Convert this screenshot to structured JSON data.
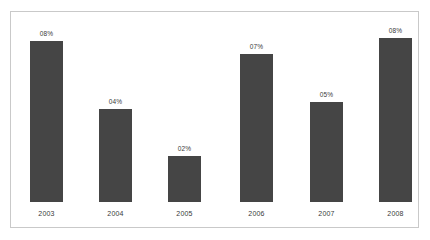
{
  "chart_data": {
    "type": "bar",
    "title": "",
    "subtitle": "",
    "xlabel": "",
    "ylabel": "",
    "categories": [
      "2003",
      "2004",
      "2005",
      "2006",
      "2007",
      "2008"
    ],
    "values": [
      8,
      4,
      2,
      7,
      5,
      8
    ],
    "data_labels": [
      "08%",
      "04%",
      "02%",
      "07%",
      "05%",
      "08%"
    ],
    "ylim": [
      0,
      8
    ],
    "grid": false,
    "legend": false,
    "legend_position": "none",
    "axis_ticks_visible": false,
    "series": [
      {
        "name": "",
        "values": [
          8,
          4,
          2,
          7,
          5,
          8
        ]
      }
    ]
  },
  "style": {
    "bar_color": "#454545",
    "background_color": "#ffffff",
    "border_color": "#c9c9c9",
    "label_color": "#3a3a3a"
  },
  "layout": {
    "bar_pixel_heights": [
      161,
      93,
      46,
      148,
      100,
      164
    ],
    "bar_pixel_lefts": [
      19,
      88,
      157,
      229,
      299,
      368
    ],
    "bar_pixel_width": 33
  }
}
